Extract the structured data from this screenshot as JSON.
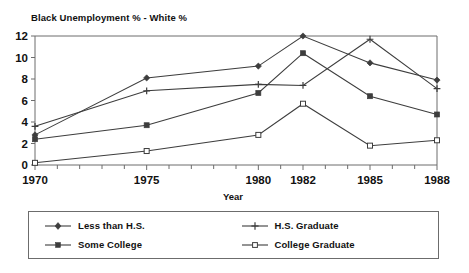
{
  "chart_data": {
    "type": "line",
    "title": "Black Unemployment % - White %",
    "xlabel": "Year",
    "ylabel": "",
    "x": [
      1970,
      1975,
      1980,
      1982,
      1985,
      1988
    ],
    "xtick_labels": [
      "1970",
      "1975",
      "1980",
      "1982",
      "1985",
      "1988"
    ],
    "ytick_labels": [
      "0",
      "2",
      "4",
      "6",
      "8",
      "10",
      "12"
    ],
    "ytick_values": [
      0,
      2,
      4,
      6,
      8,
      10,
      12
    ],
    "ylim": [
      0,
      12
    ],
    "grid": false,
    "legend_position": "below-plot",
    "series": [
      {
        "name": "Less than H.S.",
        "marker": "diamond",
        "values": [
          2.8,
          8.1,
          9.2,
          12.0,
          9.5,
          7.9
        ]
      },
      {
        "name": "H.S. Graduate",
        "marker": "plus",
        "values": [
          3.6,
          6.9,
          7.5,
          7.4,
          11.7,
          7.1
        ]
      },
      {
        "name": "Some College",
        "marker": "filled-square",
        "values": [
          2.4,
          3.7,
          6.7,
          10.4,
          6.4,
          4.7
        ]
      },
      {
        "name": "College Graduate",
        "marker": "open-square",
        "values": [
          0.2,
          1.3,
          2.8,
          5.7,
          1.8,
          2.3
        ]
      }
    ],
    "line_color": "#3d3d3d",
    "axis_color": "#6c6c6c"
  },
  "legend": {
    "items": [
      {
        "label": "Less than H.S."
      },
      {
        "label": "H.S. Graduate"
      },
      {
        "label": "Some College"
      },
      {
        "label": "College Graduate"
      }
    ]
  }
}
